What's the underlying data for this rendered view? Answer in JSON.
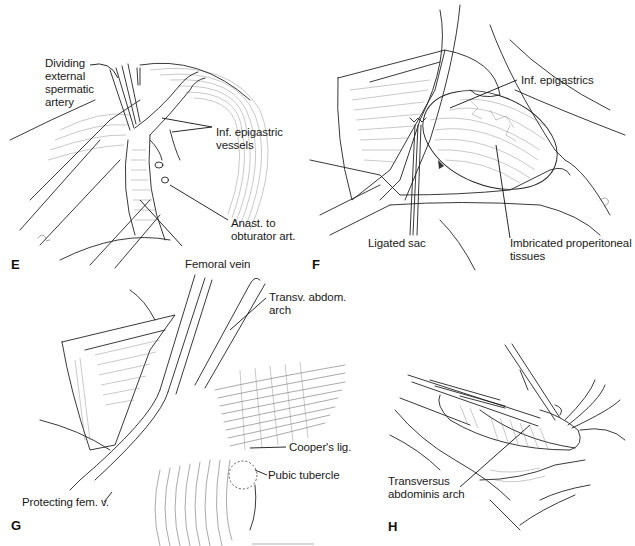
{
  "figure": {
    "panels": [
      {
        "id": "E",
        "letter": "E",
        "labels": {
          "dividing_artery": "Dividing\nexternal\nspermatic\nartery",
          "inf_epigastric_vessels": "Inf. epigastric\nvessels",
          "anast_obturator": "Anast. to\nobturator art.",
          "femoral_vein": "Femoral vein"
        }
      },
      {
        "id": "F",
        "letter": "F",
        "labels": {
          "inf_epigastrics": "Inf. epigastrics",
          "ligated_sac": "Ligated sac",
          "imbricated_tissues": "Imbricated properitoneal\ntissues"
        }
      },
      {
        "id": "G",
        "letter": "G",
        "labels": {
          "transv_abdom_arch": "Transv. abdom. arch",
          "coopers_lig": "Cooper's lig.",
          "pubic_tubercle": "Pubic tubercle",
          "protecting_fem_v": "Protecting fem. v."
        }
      },
      {
        "id": "H",
        "letter": "H",
        "labels": {
          "transversus_arch": "Transversus\nabdominis arch"
        }
      }
    ],
    "colors": {
      "ink": "#222222",
      "background": "#ffffff"
    }
  }
}
